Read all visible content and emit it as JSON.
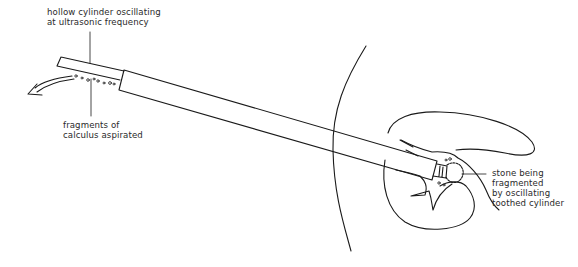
{
  "diagram": {
    "labels": {
      "hollow_cylinder": {
        "line1": "hollow cylinder oscillating",
        "line2": "at ultrasonic frequency"
      },
      "fragments": {
        "line1": "fragments of",
        "line2": "calculus aspirated"
      },
      "stone": {
        "line1": "stone being",
        "line2": "fragmented",
        "line3": "by oscillating",
        "line4": "toothed cylinder"
      }
    },
    "elements": [
      "probe-thin-tube",
      "probe-wide-sheath",
      "aspiration-arrow",
      "calculus-fragments",
      "body-wall-outline",
      "kidney-outline",
      "renal-pelvis",
      "toothed-tip",
      "stone"
    ],
    "colors": {
      "line": "#1a1a1a",
      "text": "#2a2a2a",
      "background": "#ffffff"
    }
  }
}
